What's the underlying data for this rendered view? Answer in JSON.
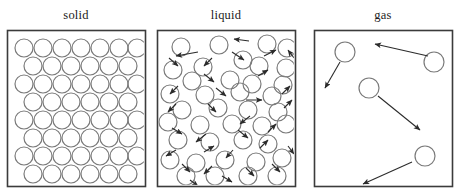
{
  "figure": {
    "caption_fragment_left": "",
    "caption_fragment_mid": "",
    "caption_fragment_right": "",
    "labels": {
      "solid": "solid",
      "liquid": "liquid",
      "gas": "gas"
    },
    "colors": {
      "box_stroke": "#3b3b3b",
      "particle_stroke": "#7a7a7a",
      "arrow_stroke": "#2b2b2b",
      "background": "#ffffff",
      "label_text": "#1b1b1b"
    },
    "boxes": [
      {
        "name": "solid",
        "x": 7,
        "y": 30,
        "w": 138,
        "h": 156
      },
      {
        "name": "liquid",
        "x": 157,
        "y": 30,
        "w": 138,
        "h": 156
      },
      {
        "name": "gas",
        "x": 314,
        "y": 30,
        "w": 138,
        "h": 156
      }
    ]
  },
  "chart_data": {
    "type": "diagram",
    "panels": [
      {
        "label": "solid",
        "description": "Particles packed in a regular close-packed lattice; no motion arrows.",
        "particle_radius": 9,
        "particle_count": 41,
        "arrow_count": 0,
        "particles": [
          [
            24,
            48
          ],
          [
            43,
            48
          ],
          [
            62,
            48
          ],
          [
            81,
            48
          ],
          [
            100,
            48
          ],
          [
            119,
            48
          ],
          [
            137,
            48
          ],
          [
            33,
            66
          ],
          [
            52,
            66
          ],
          [
            71,
            66
          ],
          [
            90,
            66
          ],
          [
            109,
            66
          ],
          [
            128,
            66
          ],
          [
            24,
            84
          ],
          [
            43,
            84
          ],
          [
            62,
            84
          ],
          [
            81,
            84
          ],
          [
            100,
            84
          ],
          [
            119,
            84
          ],
          [
            137,
            84
          ],
          [
            33,
            102
          ],
          [
            52,
            102
          ],
          [
            71,
            102
          ],
          [
            90,
            102
          ],
          [
            109,
            102
          ],
          [
            128,
            102
          ],
          [
            24,
            120
          ],
          [
            43,
            120
          ],
          [
            62,
            120
          ],
          [
            81,
            120
          ],
          [
            100,
            120
          ],
          [
            119,
            120
          ],
          [
            137,
            120
          ],
          [
            33,
            138
          ],
          [
            52,
            138
          ],
          [
            71,
            138
          ],
          [
            90,
            138
          ],
          [
            109,
            138
          ],
          [
            128,
            138
          ],
          [
            24,
            156
          ],
          [
            43,
            156
          ],
          [
            62,
            156
          ],
          [
            81,
            156
          ],
          [
            100,
            156
          ],
          [
            119,
            156
          ],
          [
            137,
            156
          ],
          [
            33,
            174
          ],
          [
            52,
            174
          ],
          [
            71,
            174
          ],
          [
            90,
            174
          ],
          [
            109,
            174
          ],
          [
            128,
            174
          ]
        ],
        "arrows": []
      },
      {
        "label": "liquid",
        "description": "Particles touching but disordered, with many short motion arrows in random directions.",
        "particle_radius": 9,
        "particle_count": 34,
        "arrow_count": 32,
        "particles": [
          [
            181,
            47
          ],
          [
            219,
            45
          ],
          [
            267,
            44
          ],
          [
            287,
            48
          ],
          [
            243,
            60
          ],
          [
            173,
            70
          ],
          [
            203,
            67
          ],
          [
            259,
            66
          ],
          [
            286,
            68
          ],
          [
            192,
            81
          ],
          [
            230,
            80
          ],
          [
            252,
            84
          ],
          [
            283,
            85
          ],
          [
            170,
            94
          ],
          [
            205,
            95
          ],
          [
            240,
            92
          ],
          [
            272,
            96
          ],
          [
            182,
            110
          ],
          [
            218,
            108
          ],
          [
            248,
            110
          ],
          [
            278,
            112
          ],
          [
            168,
            122
          ],
          [
            200,
            125
          ],
          [
            232,
            124
          ],
          [
            262,
            126
          ],
          [
            286,
            124
          ],
          [
            178,
            140
          ],
          [
            210,
            142
          ],
          [
            243,
            140
          ],
          [
            268,
            144
          ],
          [
            170,
            160
          ],
          [
            196,
            163
          ],
          [
            225,
            160
          ],
          [
            256,
            162
          ],
          [
            282,
            158
          ],
          [
            186,
            176
          ],
          [
            215,
            176
          ],
          [
            248,
            176
          ],
          [
            277,
            176
          ]
        ],
        "arrows": [
          [
            198,
            52,
            176,
            56
          ],
          [
            169,
            58,
            178,
            66
          ],
          [
            212,
            58,
            204,
            66
          ],
          [
            232,
            52,
            244,
            60
          ],
          [
            249,
            41,
            234,
            39
          ],
          [
            294,
            58,
            288,
            50
          ],
          [
            204,
            74,
            214,
            82
          ],
          [
            264,
            56,
            276,
            50
          ],
          [
            258,
            76,
            268,
            70
          ],
          [
            178,
            86,
            170,
            94
          ],
          [
            216,
            88,
            226,
            96
          ],
          [
            246,
            100,
            262,
            100
          ],
          [
            282,
            94,
            290,
            86
          ],
          [
            176,
            104,
            168,
            112
          ],
          [
            208,
            104,
            216,
            112
          ],
          [
            250,
            116,
            240,
            124
          ],
          [
            284,
            108,
            292,
            100
          ],
          [
            172,
            128,
            182,
            134
          ],
          [
            206,
            134,
            196,
            142
          ],
          [
            238,
            130,
            248,
            138
          ],
          [
            268,
            132,
            276,
            124
          ],
          [
            176,
            150,
            166,
            156
          ],
          [
            204,
            152,
            214,
            146
          ],
          [
            233,
            150,
            226,
            158
          ],
          [
            260,
            148,
            268,
            140
          ],
          [
            288,
            146,
            294,
            154
          ],
          [
            182,
            164,
            190,
            172
          ],
          [
            212,
            166,
            204,
            174
          ],
          [
            246,
            168,
            254,
            176
          ],
          [
            272,
            164,
            280,
            172
          ],
          [
            222,
            176,
            232,
            182
          ],
          [
            190,
            180,
            198,
            186
          ]
        ]
      },
      {
        "label": "gas",
        "description": "Four widely separated particles, each with a long motion arrow; large empty space.",
        "particle_radius": 10,
        "particle_count": 4,
        "arrow_count": 4,
        "particles": [
          [
            345,
            52
          ],
          [
            434,
            62
          ],
          [
            369,
            88
          ],
          [
            425,
            156
          ]
        ],
        "arrows": [
          [
            340,
            62,
            325,
            88
          ],
          [
            428,
            56,
            375,
            44
          ],
          [
            378,
            96,
            420,
            130
          ],
          [
            412,
            162,
            363,
            184
          ]
        ]
      }
    ]
  }
}
